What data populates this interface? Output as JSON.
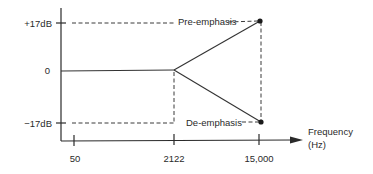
{
  "diagram": {
    "y_axis": {
      "ticks": [
        {
          "label": "+17dB",
          "value": 17
        },
        {
          "label": "0",
          "value": 0
        },
        {
          "label": "−17dB",
          "value": -17
        }
      ]
    },
    "x_axis": {
      "label_line1": "Frequency",
      "label_line2": "(Hz)",
      "ticks": [
        {
          "label": "50",
          "value": 50
        },
        {
          "label": "2122",
          "value": 2122
        },
        {
          "label": "15,000",
          "value": 15000
        }
      ]
    },
    "curves": [
      {
        "name": "Pre-emphasis",
        "label": "Pre-emphasis",
        "points": [
          [
            50,
            0
          ],
          [
            2122,
            0
          ],
          [
            15000,
            17
          ]
        ]
      },
      {
        "name": "De-emphasis",
        "label": "De-emphasis",
        "points": [
          [
            50,
            0
          ],
          [
            2122,
            0
          ],
          [
            15000,
            -17
          ]
        ]
      }
    ],
    "colors": {
      "line": "#2a2a2a",
      "background": "#ffffff"
    }
  }
}
